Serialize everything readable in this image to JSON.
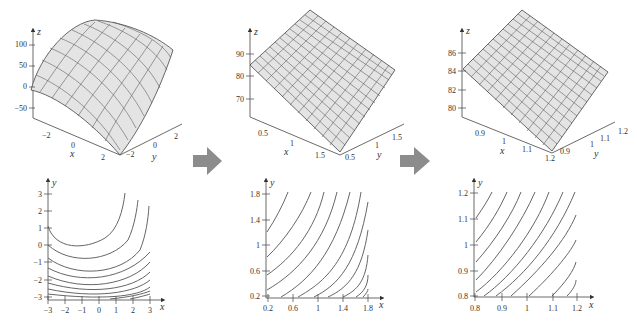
{
  "figure": {
    "arrow_color": "#8c8c8c",
    "surface_fill": "#e4e4e4",
    "line_color": "#555555",
    "panels": [
      {
        "surface": {
          "z_label": "z",
          "x_label": "x",
          "y_label": "y",
          "z_ticks": [
            "100",
            "50",
            "0",
            "−50"
          ],
          "x_ticks": [
            "−2",
            "0",
            "2"
          ],
          "y_ticks": [
            "−2",
            "0",
            "2"
          ]
        },
        "contour": {
          "x_label": "x",
          "y_label": "y",
          "x_ticks": [
            "−3",
            "−2",
            "−1",
            "0",
            "1",
            "2",
            "3"
          ],
          "y_ticks": [
            "3",
            "2",
            "1",
            "0",
            "−1",
            "−2",
            "−3"
          ],
          "xlim": [
            -3,
            3
          ],
          "ylim": [
            -3,
            3
          ]
        }
      },
      {
        "surface": {
          "z_label": "z",
          "x_label": "x",
          "y_label": "y",
          "z_ticks": [
            "90",
            "80",
            "70"
          ],
          "x_ticks": [
            "0.5",
            "1",
            "1.5"
          ],
          "y_ticks": [
            "0.5",
            "1",
            "1.5"
          ]
        },
        "contour": {
          "x_label": "x",
          "y_label": "y",
          "x_ticks": [
            "0.2",
            "0.6",
            "1",
            "1.4",
            "1.8"
          ],
          "y_ticks": [
            "1.8",
            "1.4",
            "1",
            "0.6",
            "0.2"
          ],
          "xlim": [
            0.2,
            1.8
          ],
          "ylim": [
            0.2,
            1.8
          ]
        }
      },
      {
        "surface": {
          "z_label": "z",
          "x_label": "x",
          "y_label": "y",
          "z_ticks": [
            "86",
            "84",
            "82",
            "80"
          ],
          "x_ticks": [
            "0.9",
            "1",
            "1.1",
            "1.2"
          ],
          "y_ticks": [
            "0.9",
            "1",
            "1.1",
            "1.2"
          ]
        },
        "contour": {
          "x_label": "x",
          "y_label": "y",
          "x_ticks": [
            "0.8",
            "0.9",
            "1",
            "1.1",
            "1.2"
          ],
          "y_ticks": [
            "1.2",
            "1.1",
            "1",
            "0.9",
            "0.8"
          ],
          "xlim": [
            0.8,
            1.2
          ],
          "ylim": [
            0.8,
            1.2
          ]
        }
      }
    ]
  }
}
